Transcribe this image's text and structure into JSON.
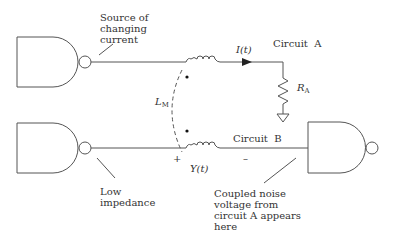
{
  "diagram": {
    "type": "circuit-schematic",
    "labels": {
      "source_note": "Source of\nchanging\ncurrent",
      "current": "I(t)",
      "circuit_a": "Circuit  A",
      "resistor_symbol": "R",
      "resistor_sub": "A",
      "mutual_symbol": "L",
      "mutual_sub": "M",
      "circuit_b": "Circuit  B",
      "plus": "+",
      "minus": "–",
      "voltage": "Y(t)",
      "low_impedance_note": "Low\nimpedance",
      "coupled_note": "Coupled noise\nvoltage from\ncircuit A appears\nhere"
    },
    "components": [
      {
        "id": "driver-a",
        "kind": "NAND gate",
        "role": "source of changing current"
      },
      {
        "id": "inductor-a",
        "kind": "inductor",
        "circuit": "A"
      },
      {
        "id": "resistor-a",
        "kind": "resistor",
        "label": "RA"
      },
      {
        "id": "ground-a",
        "kind": "ground"
      },
      {
        "id": "mutual",
        "kind": "mutual inductance",
        "label": "LM"
      },
      {
        "id": "driver-b",
        "kind": "NAND gate",
        "role": "low impedance"
      },
      {
        "id": "inductor-b",
        "kind": "inductor",
        "circuit": "B"
      },
      {
        "id": "receiver-b",
        "kind": "NAND gate",
        "role": "receiver"
      }
    ],
    "colors": {
      "line": "#555555",
      "text": "#333333",
      "background": "#ffffff"
    }
  }
}
